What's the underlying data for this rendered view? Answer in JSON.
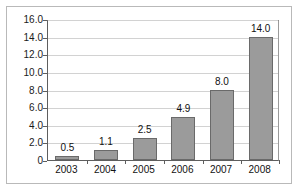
{
  "chart_data": {
    "type": "bar",
    "title": "",
    "subtitle": "",
    "xlabel": "",
    "ylabel": "",
    "categories": [
      "2003",
      "2004",
      "2005",
      "2006",
      "2007",
      "2008"
    ],
    "values": [
      0.5,
      1.1,
      2.5,
      4.9,
      8.0,
      14.0
    ],
    "data_labels": [
      "0.5",
      "1.1",
      "2.5",
      "4.9",
      "8.0",
      "14.0"
    ],
    "ylim": [
      0,
      16
    ],
    "ytick_values": [
      16.0,
      14.0,
      12.0,
      10.0,
      8.0,
      6.0,
      4.0,
      2.0,
      0
    ],
    "ytick_labels": [
      "16.0",
      "14.0",
      "12.0",
      "10.0",
      "8.0",
      "6.0",
      "4.0",
      "2.0",
      "0"
    ],
    "grid": true,
    "grid_axis": "y",
    "legend": false,
    "legend_position": "none",
    "series": [
      {
        "name": "",
        "values": [
          0.5,
          1.1,
          2.5,
          4.9,
          8.0,
          14.0
        ]
      }
    ],
    "colors": {
      "bar_fill": "#9b9b9b",
      "bar_border": "#6a6a6a",
      "gridline": "#d2d2d2",
      "axis": "#5e5e5e",
      "frame": "#b9b9b9",
      "text": "#111111",
      "background": "#ffffff"
    }
  }
}
